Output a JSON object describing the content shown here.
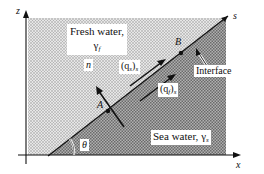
{
  "figure": {
    "axes": {
      "x_label": "x",
      "z_label": "z",
      "s_label": "s",
      "n_label": "n",
      "angle_label": "θ"
    },
    "regions": {
      "fresh": {
        "line1": "Fresh water,",
        "symbol": "γ",
        "subscript": "f"
      },
      "sea": {
        "text": "Sea water, ",
        "symbol": "γ",
        "subscript": "s"
      }
    },
    "points": {
      "a": "A",
      "b": "B"
    },
    "flux_labels": {
      "qs": {
        "open": "(q",
        "sub": "s",
        "close": ")",
        "outer_sub": "s"
      },
      "qf": {
        "open": "(q",
        "sub": "f",
        "close": ")",
        "outer_sub": "s"
      }
    },
    "interface_label": "Interface",
    "colors": {
      "fresh_shade": "#c8c8c8",
      "sea_shade": "#9a9a9a",
      "line": "#111111"
    }
  }
}
